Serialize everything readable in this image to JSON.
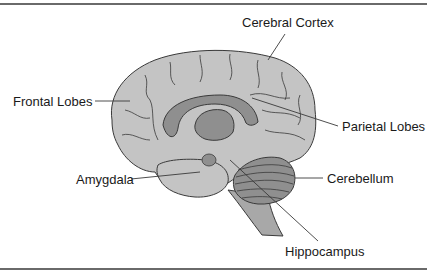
{
  "diagram": {
    "colors": {
      "cortex_fill": "#c4c4c4",
      "dark_fill": "#8f8f8f",
      "outline": "#3a3a3a",
      "rule": "#6a6a6a"
    },
    "labels": [
      {
        "id": "cerebral-cortex",
        "text": "Cerebral Cortex"
      },
      {
        "id": "frontal-lobes",
        "text": "Frontal Lobes"
      },
      {
        "id": "parietal-lobes",
        "text": "Parietal Lobes"
      },
      {
        "id": "amygdala",
        "text": "Amygdala"
      },
      {
        "id": "cerebellum",
        "text": "Cerebellum"
      },
      {
        "id": "hippocampus",
        "text": "Hippocampus"
      }
    ]
  }
}
